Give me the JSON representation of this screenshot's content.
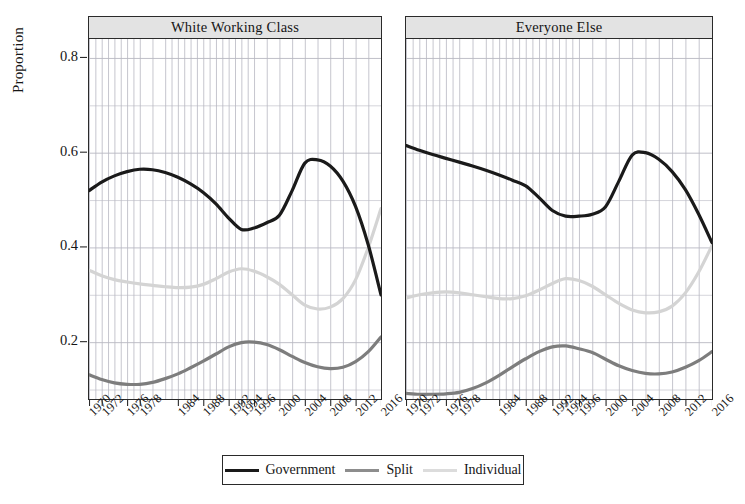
{
  "chart_data": {
    "type": "line",
    "title": "",
    "xlabel": "",
    "ylabel": "Proportion",
    "ylim": [
      0.08,
      0.84
    ],
    "xlim": [
      1970,
      2016
    ],
    "grid": true,
    "legend_position": "bottom",
    "y_ticks": [
      "0.8",
      "0.6",
      "0.4",
      "0.2"
    ],
    "y_tick_values": [
      0.8,
      0.6,
      0.4,
      0.2
    ],
    "x_ticks": [
      "1970",
      "1972",
      "1976",
      "1978",
      "1984",
      "1988",
      "1992",
      "1994",
      "1996",
      "2000",
      "2004",
      "2008",
      "2012",
      "2016"
    ],
    "x_tick_values": [
      1970,
      1972,
      1976,
      1978,
      1984,
      1988,
      1992,
      1994,
      1996,
      2000,
      2004,
      2008,
      2012,
      2016
    ],
    "panels": [
      {
        "label": "White Working Class",
        "series": [
          {
            "name": "Government",
            "color": "#1a1a1a",
            "width": 3.2,
            "x": [
              1970,
              1972,
              1974,
              1976,
              1978,
              1980,
              1982,
              1984,
              1986,
              1988,
              1990,
              1992,
              1994,
              1996,
              1998,
              2000,
              2002,
              2004,
              2006,
              2008,
              2010,
              2012,
              2014,
              2016
            ],
            "values": [
              0.52,
              0.538,
              0.551,
              0.56,
              0.565,
              0.564,
              0.558,
              0.548,
              0.534,
              0.516,
              0.492,
              0.462,
              0.438,
              0.441,
              0.452,
              0.468,
              0.52,
              0.578,
              0.585,
              0.572,
              0.54,
              0.486,
              0.405,
              0.3
            ]
          },
          {
            "name": "Split",
            "color": "#7d7d7d",
            "width": 3.2,
            "x": [
              1970,
              1972,
              1974,
              1976,
              1978,
              1980,
              1982,
              1984,
              1986,
              1988,
              1990,
              1992,
              1994,
              1996,
              1998,
              2000,
              2002,
              2004,
              2006,
              2008,
              2010,
              2012,
              2014,
              2016
            ],
            "values": [
              0.131,
              0.121,
              0.114,
              0.111,
              0.111,
              0.115,
              0.123,
              0.133,
              0.146,
              0.16,
              0.175,
              0.19,
              0.199,
              0.2,
              0.195,
              0.184,
              0.17,
              0.157,
              0.148,
              0.144,
              0.147,
              0.159,
              0.18,
              0.211
            ]
          },
          {
            "name": "Individual",
            "color": "#d4d4d4",
            "width": 3.2,
            "x": [
              1970,
              1972,
              1974,
              1976,
              1978,
              1980,
              1982,
              1984,
              1986,
              1988,
              1990,
              1992,
              1994,
              1996,
              1998,
              2000,
              2002,
              2004,
              2006,
              2008,
              2010,
              2012,
              2014,
              2016
            ],
            "values": [
              0.352,
              0.34,
              0.332,
              0.327,
              0.323,
              0.32,
              0.317,
              0.315,
              0.316,
              0.322,
              0.334,
              0.348,
              0.355,
              0.35,
              0.338,
              0.322,
              0.3,
              0.278,
              0.27,
              0.274,
              0.292,
              0.332,
              0.4,
              0.482
            ]
          }
        ]
      },
      {
        "label": "Everyone Else",
        "series": [
          {
            "name": "Government",
            "color": "#1a1a1a",
            "width": 3.2,
            "x": [
              1970,
              1972,
              1974,
              1976,
              1978,
              1980,
              1982,
              1984,
              1986,
              1988,
              1990,
              1992,
              1994,
              1996,
              1998,
              2000,
              2002,
              2004,
              2006,
              2008,
              2010,
              2012,
              2014,
              2016
            ],
            "values": [
              0.615,
              0.605,
              0.596,
              0.588,
              0.58,
              0.572,
              0.563,
              0.553,
              0.542,
              0.53,
              0.505,
              0.478,
              0.466,
              0.466,
              0.47,
              0.486,
              0.54,
              0.595,
              0.6,
              0.586,
              0.56,
              0.522,
              0.47,
              0.41
            ]
          },
          {
            "name": "Split",
            "color": "#7d7d7d",
            "width": 3.2,
            "x": [
              1970,
              1972,
              1974,
              1976,
              1978,
              1980,
              1982,
              1984,
              1986,
              1988,
              1990,
              1992,
              1994,
              1996,
              1998,
              2000,
              2002,
              2004,
              2006,
              2008,
              2010,
              2012,
              2014,
              2016
            ],
            "values": [
              0.092,
              0.09,
              0.09,
              0.091,
              0.094,
              0.102,
              0.114,
              0.13,
              0.148,
              0.165,
              0.18,
              0.19,
              0.192,
              0.186,
              0.178,
              0.164,
              0.15,
              0.14,
              0.134,
              0.133,
              0.137,
              0.147,
              0.161,
              0.18
            ]
          },
          {
            "name": "Individual",
            "color": "#d4d4d4",
            "width": 3.2,
            "x": [
              1970,
              1972,
              1974,
              1976,
              1978,
              1980,
              1982,
              1984,
              1986,
              1988,
              1990,
              1992,
              1994,
              1996,
              1998,
              2000,
              2002,
              2004,
              2006,
              2008,
              2010,
              2012,
              2014,
              2016
            ],
            "values": [
              0.293,
              0.3,
              0.304,
              0.306,
              0.304,
              0.3,
              0.296,
              0.292,
              0.292,
              0.298,
              0.31,
              0.324,
              0.334,
              0.33,
              0.318,
              0.3,
              0.282,
              0.268,
              0.262,
              0.264,
              0.276,
              0.304,
              0.348,
              0.404
            ]
          }
        ]
      }
    ],
    "legend": [
      {
        "label": "Government",
        "color": "#1a1a1a"
      },
      {
        "label": "Split",
        "color": "#8d8d8d"
      },
      {
        "label": "Individual",
        "color": "#dcdcdc"
      }
    ],
    "minor_gridline_years": [
      1970,
      1971,
      1972,
      1973,
      1974,
      1975,
      1976,
      1977,
      1978,
      1980,
      1982,
      1983,
      1984,
      1985,
      1986,
      1987,
      1988,
      1989,
      1990,
      1991,
      1992,
      1993,
      1994,
      1995,
      1996,
      1998,
      2000,
      2002,
      2004,
      2006,
      2008,
      2010,
      2012,
      2014,
      2016
    ]
  }
}
